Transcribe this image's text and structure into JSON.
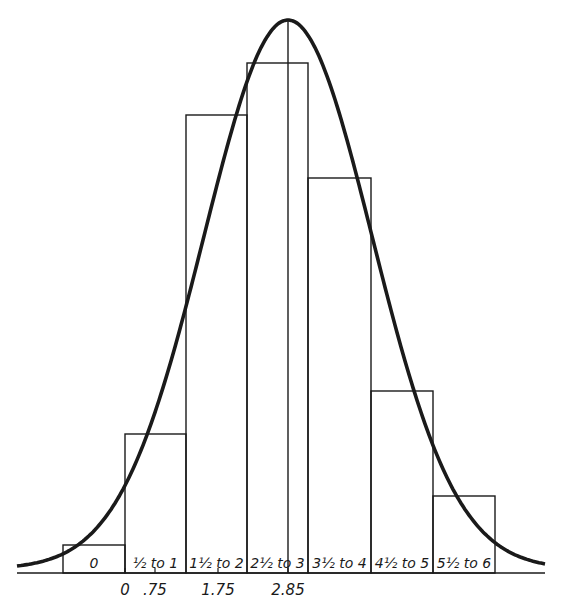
{
  "chart_data": {
    "type": "bar",
    "subtype": "histogram-with-normal-curve",
    "title": "",
    "xlabel": "",
    "ylabel": "",
    "categories": [
      "0",
      "½ to 1",
      "1½ to 2",
      "2½ to 3",
      "3½ to 4",
      "4½ to 5",
      "5½ to 6"
    ],
    "values": [
      28,
      139,
      458,
      510,
      395,
      182,
      77
    ],
    "value_units": "relative bar height (pixels above baseline, no y-axis shown)",
    "x_tick_labels": [
      {
        "label": "0",
        "position": "right edge of first bar"
      },
      {
        "label": ".75",
        "position": "under ½ to 1 bar"
      },
      {
        "label": "1.75",
        "position": "under 1½ to 2 bar"
      },
      {
        "label": "2.85",
        "position": "at mean line"
      }
    ],
    "overlay": {
      "type": "normal-curve",
      "mean": 2.85,
      "mean_line": true
    },
    "grid": false,
    "legend": null,
    "colors": {
      "ink": "#1a1a1a",
      "background": "#ffffff"
    }
  },
  "layout": {
    "baseline_y": 573,
    "bar_edges_x": [
      63,
      125,
      186,
      247,
      308,
      371,
      433,
      495
    ],
    "axis_x_start": 17,
    "axis_x_end": 545,
    "mean_x": 288,
    "curve_peak_y": 20
  }
}
